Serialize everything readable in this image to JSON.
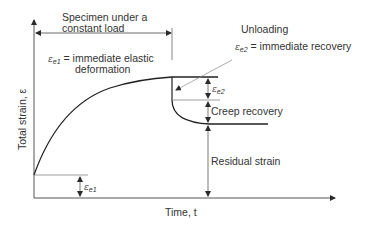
{
  "diagram": {
    "title": "",
    "labels": {
      "load_period": "Specimen under a constant load",
      "load_period_line1": "Specimen under a",
      "load_period_line2": "constant load",
      "e1_symbol": "ε",
      "e1_sub": "e1",
      "e1_def_line1": "= immediate elastic",
      "e1_def_line2": "deformation",
      "unloading": "Unloading",
      "e2_symbol": "ε",
      "e2_sub": "e2",
      "e2_def": "= immediate recovery",
      "e2_dim_symbol": "ε",
      "e2_dim_sub": "e2",
      "creep_recovery": "Creep recovery",
      "residual_strain": "Residual strain",
      "e1_dim_symbol": "ε",
      "e1_dim_sub": "e1",
      "y_axis": "Total strain, ε",
      "x_axis": "Time, t"
    },
    "colors": {
      "line": "#2a2a2a",
      "text": "#333333"
    }
  }
}
